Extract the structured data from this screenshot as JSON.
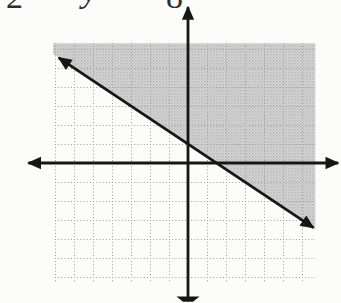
{
  "figure": {
    "cropped_text_fragments": [
      "2",
      "y",
      "8"
    ]
  },
  "chart_data": {
    "type": "line",
    "title": "",
    "xlabel": "",
    "ylabel": "",
    "tick_labels": "none",
    "grid": {
      "style": "dotted",
      "spacing": 1,
      "x_range": [
        -7.1,
        6.7
      ],
      "y_range": [
        -6.3,
        6.3
      ]
    },
    "axes": {
      "x_axis_range": [
        -8.4,
        7.9
      ],
      "y_axis_range": [
        -7.2,
        8.2
      ],
      "arrowheads": "both ends; bottom y-axis arrowhead cropped by image edge"
    },
    "boundary_line": {
      "slope": -0.6667,
      "y_intercept": 1,
      "x_intercept": 1.5,
      "endpoints": [
        [
          -6.8,
          5.53
        ],
        [
          6.6,
          -3.4
        ]
      ],
      "style": "solid",
      "arrows": "both"
    },
    "shaded_region": {
      "relation": "above-line",
      "inequality": "y ≥ -(2/3)x + 1",
      "fill": "halftone-gray",
      "clip": "grid-rectangle"
    },
    "colors": {
      "line": "#161616",
      "grid": "#9b9b9b",
      "shade_light": "#d6d6d6",
      "shade_mid": "#c7c7c7",
      "shade_dark": "#b9b9b9",
      "background": "#fcfcfa"
    }
  }
}
